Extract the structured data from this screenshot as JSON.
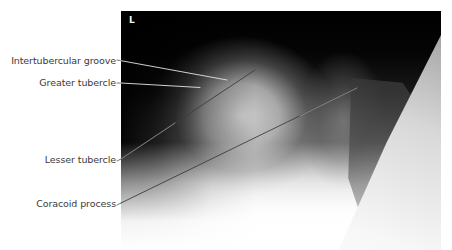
{
  "figure": {
    "side_marker": "L",
    "labels": [
      {
        "id": "intertubercular-groove",
        "text": "Intertubercular groove"
      },
      {
        "id": "greater-tubercle",
        "text": "Greater tubercle"
      },
      {
        "id": "lesser-tubercle",
        "text": "Lesser tubercle"
      },
      {
        "id": "coracoid-process",
        "text": "Coracoid process"
      }
    ]
  },
  "colors": {
    "label_text": "#3a3a3a",
    "leader_line_on_white": "#555555",
    "leader_line_on_film": "#e6e6e6",
    "film_dark": "#000000",
    "background": "#ffffff"
  }
}
